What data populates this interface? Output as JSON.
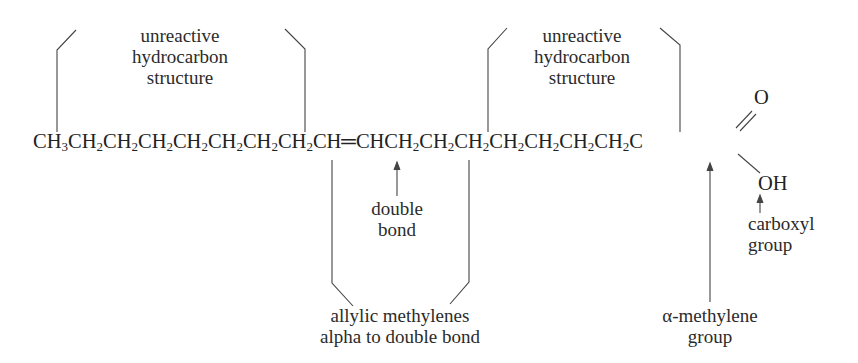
{
  "diagram": {
    "type": "annotated chemical structure (unsaturated fatty acid)",
    "chain": {
      "segments": [
        "CH",
        "3",
        "CH",
        "2",
        "CH",
        "2",
        "CH",
        "2",
        "CH",
        "2",
        "CH",
        "2",
        "CH",
        "2",
        "CH",
        "2",
        "CH",
        "═",
        "CHCH",
        "2",
        "CH",
        "2",
        "CH",
        "2",
        "CH",
        "2",
        "CH",
        "2",
        "CH",
        "2",
        "CH",
        "2",
        "C"
      ],
      "text": "CH3CH2CH2CH2CH2CH2CH2CH2CH═CHCH2CH2CH2CH2CH2CH2CH2C",
      "carbonyl_oxygen": "O",
      "hydroxyl": "OH"
    },
    "labels": {
      "unreactive_left": [
        "unreactive",
        "hydrocarbon",
        "structure"
      ],
      "unreactive_right": [
        "unreactive",
        "hydrocarbon",
        "structure"
      ],
      "double_bond": [
        "double",
        "bond"
      ],
      "allylic": [
        "allylic methylenes",
        "alpha to double bond"
      ],
      "alpha_methylene": [
        "α-methylene",
        "group"
      ],
      "carboxyl": [
        "carboxyl",
        "group"
      ]
    }
  }
}
